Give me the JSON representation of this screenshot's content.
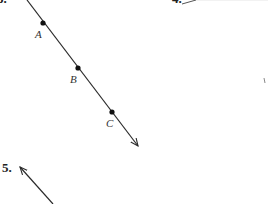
{
  "problems": [
    {
      "number": "3.",
      "visible": "partial"
    },
    {
      "number": "4.",
      "visible": "partial"
    },
    {
      "number": "5."
    }
  ],
  "figure_3": {
    "type": "ray",
    "points": [
      {
        "label": "A",
        "x": 43,
        "y": 23
      },
      {
        "label": "B",
        "x": 78,
        "y": 68
      },
      {
        "label": "C",
        "x": 112,
        "y": 112
      }
    ],
    "start": {
      "x": 27,
      "y": 0
    },
    "arrow_tip": {
      "x": 138,
      "y": 146
    }
  },
  "figure_5": {
    "type": "ray",
    "arrow_tip": {
      "x": 20,
      "y": 167
    },
    "end": {
      "x": 53,
      "y": 204
    }
  },
  "colors": {
    "line": "#2a2a2a",
    "text": "#222222",
    "background": "#ffffff"
  }
}
